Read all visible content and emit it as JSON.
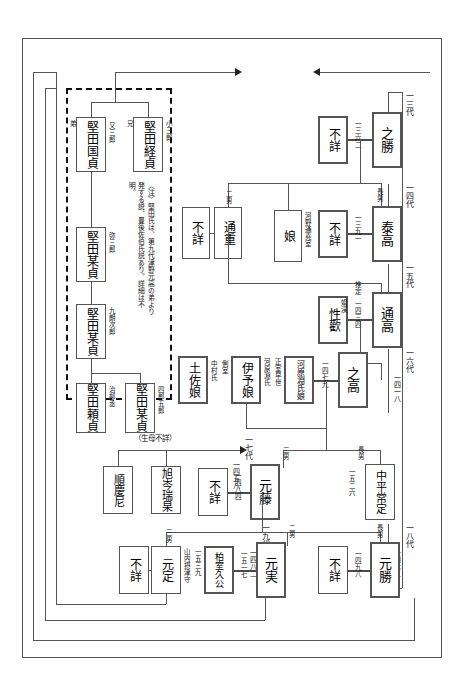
{
  "diagram": {
    "note": "〈注〉堅田氏は、第九代津野元高の弟より発する説、豊後佐伯氏説あり。詳細は不明。",
    "generation_labels": [
      {
        "id": "g13",
        "gen": "一三代",
        "year": "一三〇三"
      },
      {
        "id": "g14",
        "gen": "一四代",
        "year": "一三五一"
      },
      {
        "id": "g15",
        "gen": "一五代",
        "year": "一三七七"
      },
      {
        "id": "g16",
        "gen": "一六代",
        "year": "一四一八"
      },
      {
        "id": "g17",
        "gen": "一七代",
        "year": "一四五八"
      },
      {
        "id": "g18",
        "gen": "一八代",
        "year": "一四七二"
      },
      {
        "id": "g19",
        "gen": "一九代",
        "year": "一四八二"
      }
    ],
    "katada_group": {
      "label": "堅田氏",
      "members": [
        {
          "id": "kunisada",
          "name": "堅田国貞",
          "rel": "弟",
          "alias": "又三郎"
        },
        {
          "id": "tsunesada",
          "name": "堅田経貞",
          "rel": "兄",
          "alias": "小三郎"
        },
        {
          "id": "bousada1",
          "name": "堅田某貞",
          "rel": "",
          "alias": "弥三郎"
        },
        {
          "id": "bousada2",
          "name": "堅田某貞",
          "rel": "",
          "alias": "九朗次郎"
        },
        {
          "id": "yorisada",
          "name": "堅田頼貞",
          "rel": "",
          "alias": "治部丞"
        },
        {
          "id": "bousada3",
          "name": "堅田某貞",
          "rel": "",
          "alias": "四郎五郎"
        }
      ]
    },
    "people": [
      {
        "id": "fushou_a",
        "name": "不詳",
        "note": ""
      },
      {
        "id": "michishige",
        "name": "通重",
        "rank": "二男"
      },
      {
        "id": "musume",
        "name": "娘",
        "note": "河野通堯室"
      },
      {
        "id": "fushou_b",
        "name": "不詳"
      },
      {
        "id": "yukikatsu",
        "name": "之勝",
        "year": "一三六二"
      },
      {
        "id": "fushou_c",
        "name": "不詳"
      },
      {
        "id": "yasutaka",
        "name": "泰高",
        "rank": "長男",
        "year": "一三九一"
      },
      {
        "id": "shoukan",
        "name": "性歡",
        "alt": "娟渓"
      },
      {
        "id": "michitaka",
        "name": "通高",
        "year": "一四三四",
        "prefix": "推定"
      },
      {
        "id": "kawaharabuchi",
        "name": "河原淵氏娘",
        "note": "正室早世"
      },
      {
        "id": "yukitaka",
        "name": "之高",
        "year": "一四七九"
      },
      {
        "id": "tosamusume",
        "name": "土佐娘",
        "note": "側室",
        "clan": "中村氏"
      },
      {
        "id": "iyomusume",
        "name": "伊予娘",
        "clan": "河原淵氏"
      },
      {
        "id": "junkeini",
        "name": "順慶尼"
      },
      {
        "id": "kyokushin",
        "name": "旭岑瑞杲"
      },
      {
        "id": "fushou_d",
        "name": "不詳"
      },
      {
        "id": "mototou",
        "name": "元藤",
        "rank": "二男",
        "year": "一四八四"
      },
      {
        "id": "nakahira",
        "name": "中平常定",
        "rank": "長男",
        "year": "一五二六"
      },
      {
        "id": "fushou_e",
        "name": "不詳"
      },
      {
        "id": "motosada",
        "name": "元定",
        "rank": "三男",
        "title": "山内摂津守",
        "year": "一五三九"
      },
      {
        "id": "hakushitsu",
        "name": "柏室久公",
        "year": "一五一七"
      },
      {
        "id": "motozane",
        "name": "元実",
        "rank": "二男"
      },
      {
        "id": "fushou_f",
        "name": "不詳",
        "year": "一四九八"
      },
      {
        "id": "motokatsu",
        "name": "元勝",
        "rank": "長男"
      }
    ],
    "annotations": {
      "seibo_fushou": "（生母不詳）",
      "suitei": "推定",
      "sokushitsu": "側室",
      "seishitsu_sousei": "正室早世"
    }
  }
}
